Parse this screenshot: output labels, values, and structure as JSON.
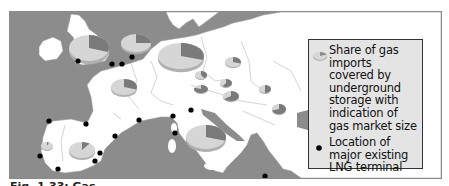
{
  "map": {
    "colors": {
      "sea": "#8c8c8c",
      "land": "#ffffff",
      "border": "#9a9a9a",
      "pie_light": "#d6d6d6",
      "pie_dark": "#7a7a7a",
      "terminal": "#000000",
      "legend_bg": "#e4e4e4"
    },
    "pies": [
      {
        "name": "uk",
        "cx": 88,
        "cy": 47,
        "rx": 20,
        "ry": 13,
        "share": 0.3
      },
      {
        "name": "netherlands",
        "cx": 135,
        "cy": 42,
        "rx": 15,
        "ry": 9,
        "share": 0.25
      },
      {
        "name": "germany",
        "cx": 180,
        "cy": 55,
        "rx": 23,
        "ry": 13,
        "share": 0.3
      },
      {
        "name": "poland",
        "cx": 232,
        "cy": 61,
        "rx": 8,
        "ry": 5,
        "share": 0.3
      },
      {
        "name": "czech",
        "cx": 200,
        "cy": 74,
        "rx": 6,
        "ry": 4,
        "share": 0.4
      },
      {
        "name": "slovakia",
        "cx": 225,
        "cy": 82,
        "rx": 6,
        "ry": 4,
        "share": 0.6
      },
      {
        "name": "austria",
        "cx": 200,
        "cy": 88,
        "rx": 7,
        "ry": 4,
        "share": 0.8
      },
      {
        "name": "hungary",
        "cx": 230,
        "cy": 95,
        "rx": 8,
        "ry": 5,
        "share": 0.65
      },
      {
        "name": "romania",
        "cx": 278,
        "cy": 108,
        "rx": 7,
        "ry": 5,
        "share": 0.7
      },
      {
        "name": "ukraine-west",
        "cx": 264,
        "cy": 88,
        "rx": 6,
        "ry": 4,
        "share": 0.5
      },
      {
        "name": "france",
        "cx": 123,
        "cy": 86,
        "rx": 13,
        "ry": 8,
        "share": 0.3
      },
      {
        "name": "spain",
        "cx": 81,
        "cy": 149,
        "rx": 13,
        "ry": 8,
        "share": 0.1
      },
      {
        "name": "portugal",
        "cx": 46,
        "cy": 145,
        "rx": 6,
        "ry": 4,
        "share": 0.05
      },
      {
        "name": "italy",
        "cx": 205,
        "cy": 136,
        "rx": 20,
        "ry": 12,
        "share": 0.3
      }
    ],
    "terminals": [
      [
        77,
        60
      ],
      [
        111,
        63
      ],
      [
        121,
        63
      ],
      [
        131,
        56
      ],
      [
        48,
        120
      ],
      [
        85,
        123
      ],
      [
        39,
        155
      ],
      [
        57,
        168
      ],
      [
        94,
        160
      ],
      [
        99,
        152
      ],
      [
        114,
        135
      ],
      [
        138,
        119
      ],
      [
        172,
        115
      ],
      [
        174,
        132
      ],
      [
        190,
        109
      ],
      [
        264,
        175
      ]
    ]
  },
  "legend": {
    "items": [
      {
        "icon": "pie-chart-icon",
        "label": "Share of gas imports covered by underground storage with indication of gas market size"
      },
      {
        "icon": "lng-terminal-dot-icon",
        "label": "Location of major existing LNG terminal"
      }
    ]
  },
  "caption": {
    "text": "Fig. 1.33: Gas"
  }
}
